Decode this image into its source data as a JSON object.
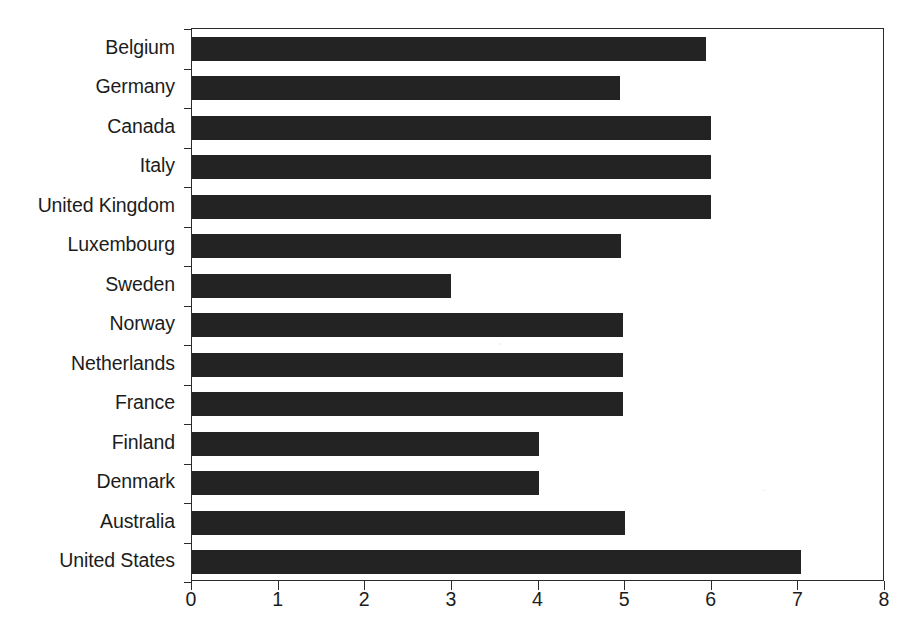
{
  "chart_data": {
    "type": "bar",
    "orientation": "horizontal",
    "title": "",
    "subtitle": "",
    "xlabel": "",
    "ylabel": "",
    "xlim": [
      0,
      8
    ],
    "ylim": [
      0,
      14
    ],
    "xticks": [
      "0",
      "1",
      "2",
      "3",
      "4",
      "5",
      "6",
      "7",
      "8"
    ],
    "xtick_values": [
      0,
      1,
      2,
      3,
      4,
      5,
      6,
      7,
      8
    ],
    "grid": false,
    "legend": null,
    "legend_position": "none",
    "bar_color": "#232323",
    "axis_color": "#2b2b2b",
    "background_color": "#ffffff",
    "categories": [
      "Belgium",
      "Germany",
      "Canada",
      "Italy",
      "United Kingdom",
      "Luxembourg",
      "Sweden",
      "Norway",
      "Netherlands",
      "France",
      "Finland",
      "Denmark",
      "Australia",
      "United States"
    ],
    "values": [
      5.93,
      4.94,
      5.99,
      5.99,
      5.99,
      4.95,
      2.99,
      4.97,
      4.97,
      4.97,
      4.0,
      4.0,
      5.0,
      7.03
    ],
    "series": [
      {
        "name": "value",
        "values": [
          5.93,
          4.94,
          5.99,
          5.99,
          5.99,
          4.95,
          2.99,
          4.97,
          4.97,
          4.97,
          4.0,
          4.0,
          5.0,
          7.03
        ]
      }
    ]
  }
}
